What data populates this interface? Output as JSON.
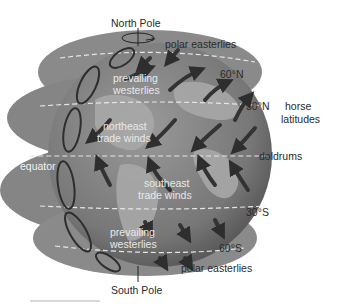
{
  "diagram": {
    "poles": {
      "north": "North Pole",
      "south": "South Pole"
    },
    "latitudes": {
      "n60": "60°N",
      "n30": "30°N",
      "s30": "30°S",
      "s60": "60°S"
    },
    "zones": {
      "polar_easterlies_north": "polar easterlies",
      "polar_easterlies_south": "polar easterlies",
      "horse_latitudes_line1": "horse",
      "horse_latitudes_line2": "latitudes",
      "doldrums": "doldrums",
      "equator": "equator"
    },
    "winds": {
      "prevailing_westerlies_north_1": "prevailing",
      "prevailing_westerlies_north_2": "westerlies",
      "northeast_trade_1": "northeast",
      "northeast_trade_2": "trade winds",
      "southeast_trade_1": "southeast",
      "southeast_trade_2": "trade winds",
      "prevailing_westerlies_south_1": "prevailing",
      "prevailing_westerlies_south_2": "westerlies"
    },
    "colors": {
      "ocean": "#7d7d7d",
      "land": "#a9a9a9",
      "arrow": "#3a3a3a",
      "dash": "#e6e6e6"
    }
  }
}
